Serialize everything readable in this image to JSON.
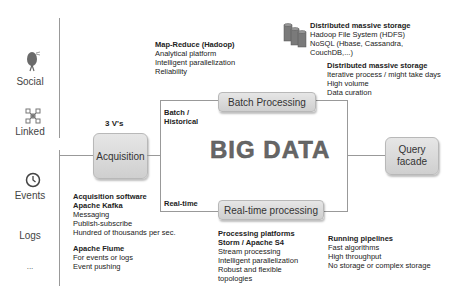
{
  "sources": [
    {
      "label": "Social",
      "icon": "social-bird-icon"
    },
    {
      "label": "Linked",
      "icon": "network-icon"
    },
    {
      "label": "Events",
      "icon": "clock-icon"
    },
    {
      "label": "Logs",
      "icon": ""
    },
    {
      "label": "...",
      "icon": ""
    }
  ],
  "three_vs": "3 V's",
  "acquisition": {
    "box": "Acquisition",
    "notes": {
      "title": "Acquisition software",
      "kafka": "Apache Kafka",
      "kafka_items": [
        "Messaging",
        "Publish-subscribe",
        "Hundred of thousands per sec."
      ],
      "flume": "Apache Flume",
      "flume_items": [
        "For events or logs",
        "Event pushing"
      ]
    }
  },
  "center": {
    "title": "BIG DATA",
    "batch_label_1": "Batch /",
    "batch_label_2": "Historical",
    "realtime_label": "Real-time"
  },
  "batch": {
    "box": "Batch Processing",
    "mapreduce": {
      "title": "Map-Reduce (Hadoop)",
      "items": [
        "Analytical platform",
        "Intelligent parallelization",
        "Reliability"
      ]
    },
    "storage1": {
      "title": "Distributed massive storage",
      "items": [
        "Hadoop File System (HDFS)",
        "NoSQL (Hbase, Cassandra,",
        "CouchDB,...)"
      ]
    },
    "storage2": {
      "title": "Distributed massive storage",
      "items": [
        "Iterative process / might take days",
        "High volume",
        "Data curation"
      ]
    }
  },
  "realtime": {
    "box": "Real-time processing",
    "platforms": {
      "title": "Processing platforms",
      "subtitle": "Storm / Apache S4",
      "items": [
        "Stream processing",
        "Intelligent parallelization",
        "Robust and flexible",
        "topologies"
      ]
    },
    "pipelines": {
      "title": "Running pipelines",
      "items": [
        "Fast algorithms",
        "High throughput",
        "No storage or complex storage"
      ]
    }
  },
  "query": {
    "box_line1": "Query",
    "box_line2": "facade"
  }
}
